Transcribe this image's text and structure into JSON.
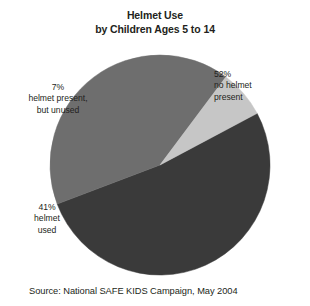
{
  "title": {
    "line1": "Helmet Use",
    "line2": "by Children Ages 5 to 14"
  },
  "source": "Source: National SAFE KIDS Campaign, May 2004",
  "labels": {
    "no_helmet": {
      "pct": "52%",
      "line1": "no helmet",
      "line2": "present"
    },
    "unused": {
      "pct": "7%",
      "line1": "helmet present,",
      "line2": "but unused"
    },
    "used": {
      "pct": "41%",
      "line1": "helmet",
      "line2": "used"
    }
  },
  "chart_data": {
    "type": "pie",
    "title": "Helmet Use by Children Ages 5 to 14",
    "subtitle": "",
    "source": "Source: National SAFE KIDS Campaign, May 2004",
    "categories": [
      "no helmet present",
      "helmet used",
      "helmet present, but unused"
    ],
    "values": [
      52,
      41,
      7
    ],
    "unit": "percent",
    "labels": [
      "52%",
      "41%",
      "7%"
    ],
    "colors": [
      "#3a3a3a",
      "#6e6e6e",
      "#c6c6c6"
    ],
    "legend": "none",
    "label_placement": "outside-callout",
    "start_angle_deg": -28,
    "direction": "clockwise",
    "total": 100,
    "geometry": {
      "cx": 160,
      "cy": 165,
      "r": 110
    }
  }
}
